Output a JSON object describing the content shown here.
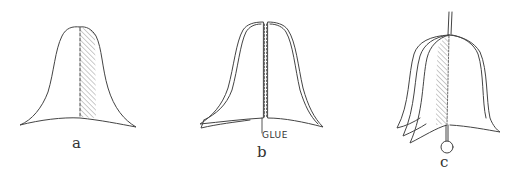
{
  "figure": {
    "stroke_color": "#444444",
    "hatch_color": "#888888",
    "panels": [
      {
        "id": "a",
        "label": "a",
        "caption": "Bell shape with hatched strip along the center fold line"
      },
      {
        "id": "b",
        "label": "b",
        "annotation": "GLUE",
        "caption": "Two bell halves opened with glue applied along center seam"
      },
      {
        "id": "c",
        "label": "c",
        "caption": "Finished layered bell hanging from a string with a ring clapper"
      }
    ]
  }
}
